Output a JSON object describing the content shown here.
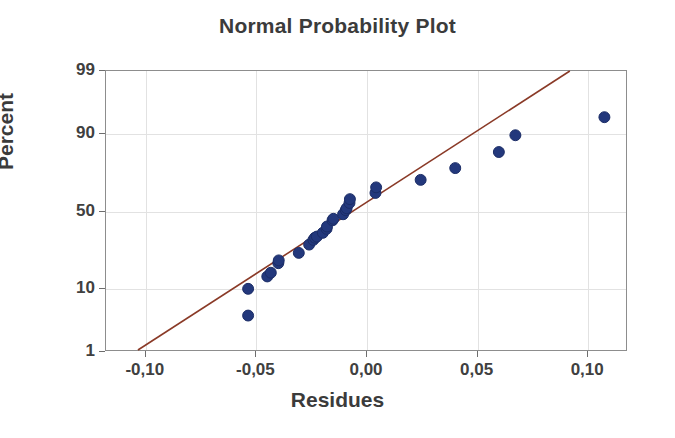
{
  "chart_data": {
    "type": "scatter",
    "title": "Normal Probability Plot",
    "xlabel": "Residues",
    "ylabel": "Percent",
    "grid": true,
    "legend": null,
    "decimal_separator": ",",
    "xlim": [
      -0.118,
      0.118
    ],
    "xticks": [
      -0.1,
      -0.05,
      0.0,
      0.05,
      0.1
    ],
    "xtick_labels": [
      "-0,10",
      "-0,05",
      "0,00",
      "0,05",
      "0,10"
    ],
    "ylim": [
      1,
      99
    ],
    "yticks": [
      1,
      10,
      50,
      90,
      99
    ],
    "ytick_labels": [
      "1",
      "10",
      "50",
      "90",
      "99"
    ],
    "y_scale": "normal-probability",
    "marker_color": "#23387c",
    "marker_edge_color": "#1b2c66",
    "marker_size": 11,
    "line_color": "#8a3a27",
    "line_width": 1.6,
    "grid_color": "#e2e2e2",
    "frame_color": "#8d8d8d",
    "text_color": "#3b3b3b",
    "reference_line": {
      "name": "normal-reference-line",
      "x_start": -0.1035,
      "y_start": 1.0,
      "x_end": 0.0925,
      "y_end": 99.0
    },
    "points": [
      {
        "x": -0.0535,
        "y": 4.0
      },
      {
        "x": -0.0535,
        "y": 9.6
      },
      {
        "x": -0.0448,
        "y": 13.6
      },
      {
        "x": -0.0432,
        "y": 15.0
      },
      {
        "x": -0.0398,
        "y": 19.0
      },
      {
        "x": -0.0396,
        "y": 20.3
      },
      {
        "x": -0.0305,
        "y": 24.0
      },
      {
        "x": -0.0258,
        "y": 28.5
      },
      {
        "x": -0.0239,
        "y": 31.2
      },
      {
        "x": -0.0232,
        "y": 32.5
      },
      {
        "x": -0.0223,
        "y": 33.2
      },
      {
        "x": -0.0196,
        "y": 35.5
      },
      {
        "x": -0.0179,
        "y": 38.0
      },
      {
        "x": -0.0177,
        "y": 39.5
      },
      {
        "x": -0.0152,
        "y": 43.5
      },
      {
        "x": -0.0148,
        "y": 44.5
      },
      {
        "x": -0.0104,
        "y": 47.5
      },
      {
        "x": -0.0092,
        "y": 50.2
      },
      {
        "x": -0.0088,
        "y": 51.5
      },
      {
        "x": -0.0075,
        "y": 55.0
      },
      {
        "x": -0.0073,
        "y": 57.5
      },
      {
        "x": 0.0043,
        "y": 61.5
      },
      {
        "x": 0.0046,
        "y": 65.0
      },
      {
        "x": 0.0248,
        "y": 69.5
      },
      {
        "x": 0.0405,
        "y": 76.0
      },
      {
        "x": 0.0603,
        "y": 83.5
      },
      {
        "x": 0.0678,
        "y": 89.5
      },
      {
        "x": 0.1082,
        "y": 94.0
      }
    ]
  }
}
